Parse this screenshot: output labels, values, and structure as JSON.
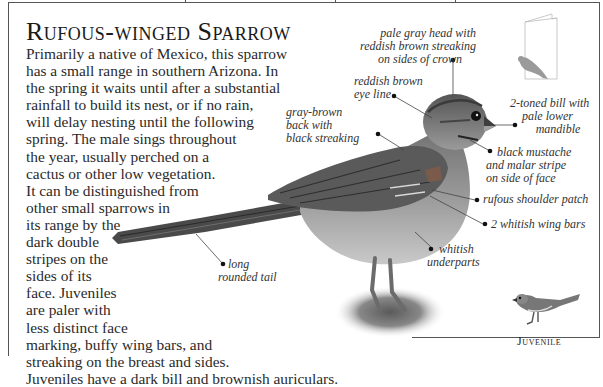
{
  "page": {
    "title": "Rufous-winged Sparrow",
    "description_lines": [
      "Primarily a native of Mexico, this sparrow",
      "has a small range in southern Arizona. In",
      "the spring it waits until after a substantial",
      "rainfall to build its nest, or if no rain,",
      "will delay nesting until the following",
      "spring. The male sings throughout",
      "the year, usually perched on a",
      "cactus or other low vegetation.",
      "It can be distinguished from",
      "other small sparrows in",
      "its range by the",
      "dark double",
      "stripes on the",
      "sides of its",
      "face. Juveniles",
      "are paler with",
      "less distinct face",
      "marking, buffy wing bars, and",
      "streaking on the breast and sides.",
      "Juveniles have a dark bill and brownish auriculars."
    ]
  },
  "annotations": {
    "crown": [
      "pale gray head with",
      "reddish brown streaking",
      "on sides of crown"
    ],
    "eye_line": [
      "reddish brown",
      "eye line"
    ],
    "back": [
      "gray-brown",
      "back with",
      "black streaking"
    ],
    "bill": [
      "2-toned bill with",
      "pale lower",
      "mandible"
    ],
    "mustache": [
      "black mustache",
      "and malar stripe",
      "on side of face"
    ],
    "shoulder": [
      "rufous shoulder patch"
    ],
    "wing_bars": [
      "2 whitish wing bars"
    ],
    "underparts": [
      "whitish",
      "underparts"
    ],
    "tail": [
      "long",
      "rounded tail"
    ]
  },
  "inset": {
    "juvenile_label": "Juvenile",
    "range_icon": "field-guide-book-icon"
  },
  "colors": {
    "text": "#2a2a2a",
    "frame": "#555555",
    "icon_gray": "#9a9a9a"
  }
}
